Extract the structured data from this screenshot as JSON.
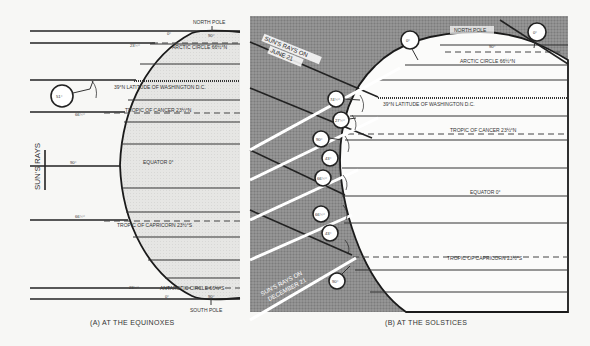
{
  "panel_a": {
    "caption": "(A) AT THE EQUINOXES",
    "suns_rays_label": "SUN'S RAYS",
    "north_pole": "NORTH POLE",
    "south_pole": "SOUTH POLE",
    "arctic_circle": "ARCTIC CIRCLE 66½°N",
    "washington": "39°N LATITUDE OF WASHINGTON D.C.",
    "tropic_cancer": "TROPIC OF CANCER 23½°N",
    "equator": "EQUATOR 0°",
    "tropic_capricorn": "TROPIC OF CAPRICORN 23½°S",
    "antarctic_circle": "ANTARCTIC CIRCLE 66½°S",
    "angles": {
      "np_left": "0°",
      "np_right": "90°",
      "arctic": "23½°",
      "washington_circle": "51°",
      "cancer": "66½°",
      "equator": "90°",
      "capricorn": "66½°",
      "antarctic": "23½°",
      "sp_left": "0°",
      "sp_right": "90°"
    }
  },
  "panel_b": {
    "caption": "(B) AT THE SOLSTICES",
    "rays_june": "SUN'S RAYS ON JUNE 21",
    "rays_june_l1": "SUN'S RAYS ON",
    "rays_june_l2": "JUNE 21",
    "rays_dec_l1": "SUN'S RAYS ON",
    "rays_dec_l2": "DECEMBER 21",
    "north_pole": "NORTH POLE",
    "arctic_circle": "ARCTIC CIRCLE 66½°N",
    "washington": "39°N LATITUDE OF WASHINGTON D.C.",
    "tropic_cancer": "TROPIC OF CANCER 23½°N",
    "equator": "EQUATOR 0°",
    "tropic_capricorn": "TROPIC OF CAPRICORN 23½°S",
    "angles": {
      "np_top": "90°",
      "circle_left_pole": "0°",
      "circle_right_pole": "0°",
      "c1": "74½°",
      "c2": "27½°",
      "c3": "90°",
      "c4": "43°",
      "c5": "66½°",
      "c6": "66½°",
      "c7": "43°",
      "c8": "90°"
    }
  }
}
